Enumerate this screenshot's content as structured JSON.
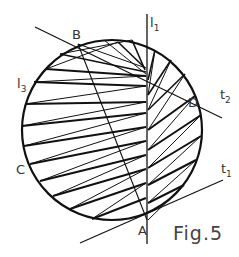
{
  "figure": {
    "caption": "Fig.5",
    "points": {
      "A": "A",
      "B": "B",
      "C": "C",
      "D": "D"
    },
    "lines": {
      "l1": {
        "base": "l",
        "sub": "1"
      },
      "l3": {
        "base": "l",
        "sub": "3"
      },
      "t1": {
        "base": "t",
        "sub": "1"
      },
      "t2": {
        "base": "t",
        "sub": "2"
      }
    },
    "colors": {
      "stroke": "#111111",
      "label": "#333333"
    }
  }
}
